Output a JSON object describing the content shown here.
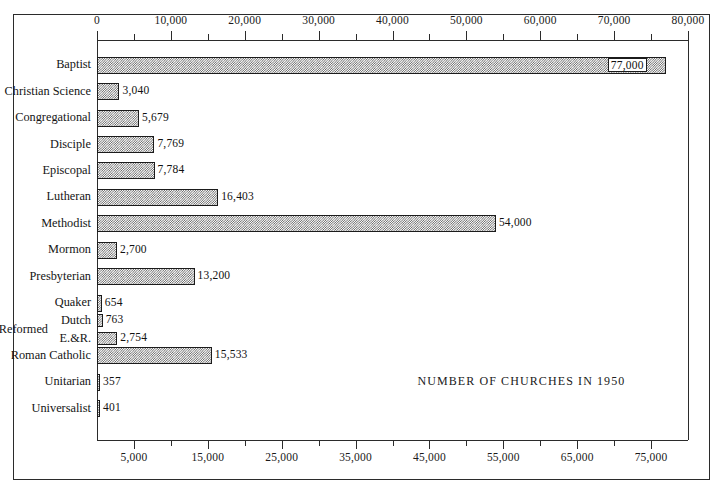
{
  "chart_data": {
    "type": "bar",
    "orientation": "horizontal",
    "title": "NUMBER OF CHURCHES IN 1950",
    "xlabel": "",
    "ylabel": "",
    "xlim": [
      0,
      80000
    ],
    "grid": false,
    "legend": "none",
    "categories": [
      "Baptist",
      "Christian Science",
      "Congregational",
      "Disciple",
      "Episcopal",
      "Lutheran",
      "Methodist",
      "Mormon",
      "Presbyterian",
      "Quaker",
      "Dutch",
      "E.&R.",
      "Roman Catholic",
      "Unitarian",
      "Universalist"
    ],
    "values": [
      77000,
      3040,
      5679,
      7769,
      7784,
      16403,
      54000,
      2700,
      13200,
      654,
      763,
      2754,
      15533,
      357,
      401
    ],
    "value_labels": [
      "77,000",
      "3,040",
      "5,679",
      "7,769",
      "7,784",
      "16,403",
      "54,000",
      "2,700",
      "13,200",
      "654",
      "763",
      "2,754",
      "15,533",
      "357",
      "401"
    ],
    "group_labels": [
      {
        "text": "Reformed",
        "members": [
          "Dutch",
          "E.&R."
        ]
      }
    ],
    "axis_top": {
      "major_ticks": [
        0,
        10000,
        20000,
        30000,
        40000,
        50000,
        60000,
        70000,
        80000
      ],
      "major_tick_labels": [
        "0",
        "10,000",
        "20,000",
        "30,000",
        "40,000",
        "50,000",
        "60,000",
        "70,000",
        "80,000"
      ],
      "minor_ticks": [
        5000,
        15000,
        25000,
        35000,
        45000,
        55000,
        65000,
        75000
      ]
    },
    "axis_bottom": {
      "major_ticks": [
        5000,
        15000,
        25000,
        35000,
        45000,
        55000,
        65000,
        75000
      ],
      "major_tick_labels": [
        "5,000",
        "15,000",
        "25,000",
        "35,000",
        "45,000",
        "55,000",
        "65,000",
        "75,000"
      ],
      "minor_ticks": [
        10000,
        20000,
        30000,
        40000,
        50000,
        60000,
        70000
      ]
    },
    "colors": {
      "bar_fill": "#5b5b5b",
      "bar_edge": "#1b1b1b",
      "axis": "#2b2b2b",
      "background": "#ffffff",
      "text": "#141414"
    }
  }
}
